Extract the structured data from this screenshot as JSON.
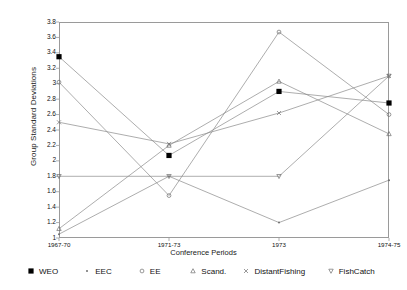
{
  "chart_data": {
    "type": "line",
    "title": "",
    "xlabel": "Conference Periods",
    "ylabel": "Group Standard Deviations",
    "categories": [
      "1967-70",
      "1971-73",
      "1973",
      "1974-75"
    ],
    "ylim": [
      1,
      3.8
    ],
    "ytick_step": 0.2,
    "yticks": [
      "1",
      "1.2",
      "1.4",
      "1.6",
      "1.8",
      "2",
      "2.2",
      "2.4",
      "2.6",
      "2.8",
      "3",
      "3.2",
      "3.4",
      "3.6",
      "3.8"
    ],
    "grid": false,
    "legend_position": "bottom",
    "series": [
      {
        "name": "WEO",
        "marker": "filled-square",
        "values": [
          3.35,
          2.07,
          2.9,
          2.75
        ]
      },
      {
        "name": "EEC",
        "marker": "dot",
        "values": [
          1.05,
          1.8,
          1.2,
          1.75
        ]
      },
      {
        "name": "EE",
        "marker": "circle",
        "values": [
          3.02,
          1.55,
          3.67,
          2.6
        ]
      },
      {
        "name": "Scand.",
        "marker": "triangle-up",
        "values": [
          1.12,
          2.2,
          3.03,
          2.35
        ]
      },
      {
        "name": "DistantFishing",
        "marker": "cross",
        "values": [
          2.5,
          2.22,
          2.62,
          3.1
        ]
      },
      {
        "name": "FishCatch",
        "marker": "triangle-down",
        "values": [
          1.8,
          1.8,
          1.8,
          3.1
        ]
      }
    ]
  },
  "legend": {
    "items": [
      {
        "label": "WEO"
      },
      {
        "label": "EEC"
      },
      {
        "label": "EE"
      },
      {
        "label": "Scand."
      },
      {
        "label": "DistantFishing"
      },
      {
        "label": "FishCatch"
      }
    ]
  },
  "axes": {
    "y_title": "Group Standard Deviations",
    "x_title": "Conference Periods"
  },
  "colors": {
    "line": "#8a8a8a",
    "frame": "#9a9a9a",
    "marker": "#6e6e6e",
    "weo_marker": "#000000",
    "text": "#111111",
    "background": "#ffffff"
  }
}
